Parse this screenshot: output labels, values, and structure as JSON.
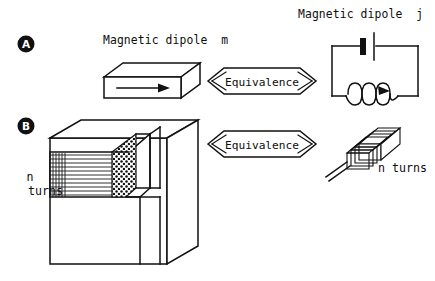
{
  "figure": {
    "background_color": "#ffffff",
    "ink_color": "#111111",
    "panels": [
      {
        "id": "A",
        "letter": "A",
        "left_label": "Magnetic dipole  m",
        "left_icon": "bar-magnet-3d-icon",
        "relation_label": "Equivalence",
        "right_label": "Magnetic dipole  j",
        "right_icon": "battery-circuit-loop-icon"
      },
      {
        "id": "B",
        "letter": "B",
        "left_label_line1": "n",
        "left_label_line2": "turns",
        "left_icon": "wound-magnetic-core-cutaway-icon",
        "relation_label": "Equivalence",
        "right_label": "n turns",
        "right_icon": "multi-turn-coil-icon"
      }
    ],
    "labels": {
      "dipole_m": "Magnetic dipole  m",
      "dipole_j": "Magnetic dipole  j",
      "equivalence_top": "Equivalence",
      "equivalence_bottom": "Equivalence",
      "n_turns_left_line1": "n",
      "n_turns_left_line2": "turns",
      "n_turns_right": "n turns",
      "panel_a_letter": "A",
      "panel_b_letter": "B"
    }
  }
}
